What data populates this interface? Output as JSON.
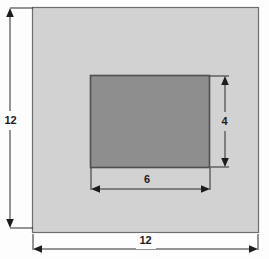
{
  "figure": {
    "type": "geometry-diagram",
    "canvas": {
      "width": 269,
      "height": 259,
      "background": "#fdfdfd"
    }
  },
  "shapes": {
    "outer_square": {
      "name": "outer-square",
      "fill": "#d2d2d2",
      "stroke": "#6e6e6e",
      "x": 32,
      "y": 7,
      "width": 227,
      "height": 226,
      "side_length": "12"
    },
    "inner_rectangle": {
      "name": "inner-rectangle",
      "fill": "#8e8e8e",
      "stroke": "#555555",
      "x": 90,
      "y": 75,
      "width": 120,
      "height": 93,
      "width_length": "6",
      "height_length": "4"
    }
  },
  "dimensions": {
    "outer_height": {
      "label": "12",
      "orientation": "vertical",
      "x": 10,
      "y1": 10,
      "y2": 226
    },
    "outer_width": {
      "label": "12",
      "orientation": "horizontal",
      "y": 248,
      "x1": 33,
      "x2": 258
    },
    "inner_height": {
      "label": "4",
      "orientation": "vertical",
      "x": 225,
      "y1": 76,
      "y2": 168
    },
    "inner_width": {
      "label": "6",
      "orientation": "horizontal",
      "y": 188,
      "x1": 91,
      "x2": 210
    }
  },
  "labels": {
    "outer_height_value": "12",
    "outer_width_value": "12",
    "inner_height_value": "4",
    "inner_width_value": "6"
  },
  "colors": {
    "outer_fill": "#d2d2d2",
    "inner_fill": "#8e8e8e",
    "line": "#2a2a2a",
    "text": "#1c1c1c"
  }
}
